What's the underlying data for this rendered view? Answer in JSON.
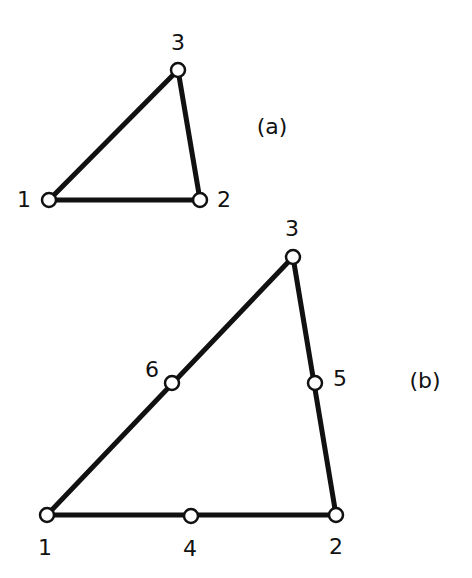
{
  "diagram": {
    "type": "finite-element-triangles",
    "figures": [
      {
        "id": "a",
        "caption": "(a)",
        "caption_pos": [
          272,
          127
        ],
        "nodes": [
          {
            "label": "1",
            "x": 49,
            "y": 200,
            "lx": 24,
            "ly": 200
          },
          {
            "label": "2",
            "x": 200,
            "y": 200,
            "lx": 224,
            "ly": 200
          },
          {
            "label": "3",
            "x": 178,
            "y": 70,
            "lx": 178,
            "ly": 43
          }
        ],
        "edges": [
          [
            "1",
            "2"
          ],
          [
            "2",
            "3"
          ],
          [
            "3",
            "1"
          ]
        ]
      },
      {
        "id": "b",
        "caption": "(b)",
        "caption_pos": [
          425,
          381
        ],
        "nodes": [
          {
            "label": "1",
            "x": 47,
            "y": 515,
            "lx": 45,
            "ly": 548
          },
          {
            "label": "2",
            "x": 336,
            "y": 515,
            "lx": 336,
            "ly": 547
          },
          {
            "label": "3",
            "x": 293,
            "y": 257,
            "lx": 292,
            "ly": 229
          },
          {
            "label": "4",
            "x": 191,
            "y": 516,
            "lx": 190,
            "ly": 549
          },
          {
            "label": "5",
            "x": 315,
            "y": 383,
            "lx": 340,
            "ly": 379
          },
          {
            "label": "6",
            "x": 172,
            "y": 383,
            "lx": 152,
            "ly": 370
          }
        ],
        "edges": [
          [
            "1",
            "2"
          ],
          [
            "2",
            "3"
          ],
          [
            "3",
            "1"
          ]
        ]
      }
    ]
  },
  "colors": {
    "stroke": "#111111",
    "background": "#ffffff"
  }
}
